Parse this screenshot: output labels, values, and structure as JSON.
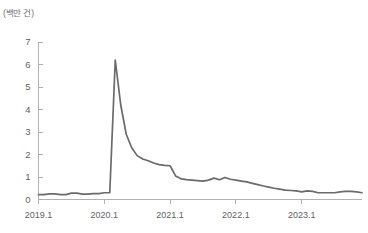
{
  "chart_data": {
    "type": "line",
    "title": "",
    "subtitle": "",
    "unit_label": "(백만 건)",
    "xlabel": "",
    "ylabel": "",
    "ylim": [
      0,
      7
    ],
    "yticks": [
      0,
      1,
      2,
      3,
      4,
      5,
      6,
      7
    ],
    "ytick_labels": [
      "0",
      "1",
      "2",
      "3",
      "4",
      "5",
      "6",
      "7"
    ],
    "xlim": [
      "2019.1",
      "2023.12"
    ],
    "xtick_labels": [
      "2019.1",
      "2020.1",
      "2021.1",
      "2022.1",
      "2023.1"
    ],
    "xtick_values": [
      "2019-01",
      "2020-01",
      "2021-01",
      "2022-01",
      "2023-01"
    ],
    "grid": false,
    "legend": false,
    "legend_position": "none",
    "line_color": "#6a6a6a",
    "axis_color": "#a8a8a8",
    "text_color": "#5f5f5f",
    "annotations": [],
    "series": [
      {
        "name": "월별 건수",
        "x": [
          "2019-01",
          "2019-02",
          "2019-03",
          "2019-04",
          "2019-05",
          "2019-06",
          "2019-07",
          "2019-08",
          "2019-09",
          "2019-10",
          "2019-11",
          "2019-12",
          "2020-01",
          "2020-02",
          "2020-03",
          "2020-04",
          "2020-05",
          "2020-06",
          "2020-07",
          "2020-08",
          "2020-09",
          "2020-10",
          "2020-11",
          "2020-12",
          "2021-01",
          "2021-02",
          "2021-03",
          "2021-04",
          "2021-05",
          "2021-06",
          "2021-07",
          "2021-08",
          "2021-09",
          "2021-10",
          "2021-11",
          "2021-12",
          "2022-01",
          "2022-02",
          "2022-03",
          "2022-04",
          "2022-05",
          "2022-06",
          "2022-07",
          "2022-08",
          "2022-09",
          "2022-10",
          "2022-11",
          "2022-12",
          "2023-01",
          "2023-02",
          "2023-03",
          "2023-04",
          "2023-05",
          "2023-06",
          "2023-07",
          "2023-08",
          "2023-09",
          "2023-10",
          "2023-11",
          "2023-12"
        ],
        "values": [
          0.22,
          0.22,
          0.25,
          0.25,
          0.22,
          0.22,
          0.28,
          0.28,
          0.24,
          0.24,
          0.26,
          0.26,
          0.3,
          0.3,
          6.2,
          4.2,
          2.9,
          2.3,
          1.95,
          1.8,
          1.72,
          1.62,
          1.55,
          1.52,
          1.5,
          1.05,
          0.92,
          0.88,
          0.86,
          0.84,
          0.82,
          0.86,
          0.95,
          0.88,
          0.98,
          0.9,
          0.86,
          0.82,
          0.78,
          0.72,
          0.66,
          0.6,
          0.55,
          0.5,
          0.46,
          0.42,
          0.4,
          0.38,
          0.34,
          0.38,
          0.36,
          0.3,
          0.3,
          0.3,
          0.3,
          0.34,
          0.36,
          0.36,
          0.34,
          0.3
        ]
      }
    ]
  },
  "axis": {
    "y_unit": "(백만 건)"
  }
}
